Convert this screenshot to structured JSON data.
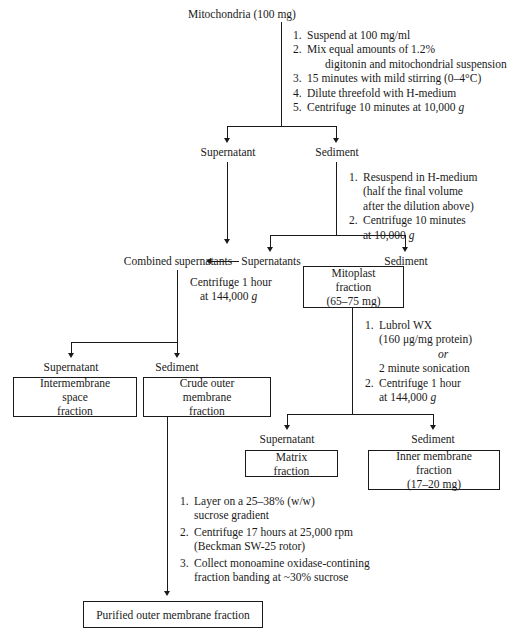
{
  "diagram": {
    "title_node": "Mitochondria (100 mg)",
    "nodes": {
      "supernatant_1": "Supernatant",
      "sediment_1": "Sediment",
      "combined_supernatants": "Combined supernatants",
      "supernatants_2": "Supernatants",
      "sediment_2": "Sediment",
      "supernatant_3": "Supernatant",
      "sediment_3": "Sediment",
      "supernatant_4": "Supernatant",
      "sediment_4": "Sediment"
    },
    "boxes": {
      "mitoplast": {
        "line1": "Mitoplast fraction",
        "line2": "(65–75 mg)"
      },
      "intermembrane": {
        "line1": "Intermembrane space",
        "line2": "fraction"
      },
      "crude_outer": {
        "line1": "Crude outer membrane",
        "line2": "fraction"
      },
      "matrix": {
        "line1": "Matrix fraction"
      },
      "inner_membrane": {
        "line1": "Inner membrane fraction",
        "line2": "(17–20 mg)"
      },
      "purified_outer": {
        "line1": "Purified outer membrane fraction"
      }
    },
    "step_groups": {
      "group1": [
        {
          "num": "1.",
          "text": "Suspend at 100 mg/ml"
        },
        {
          "num": "2.",
          "text": "Mix equal amounts of 1.2%",
          "cont": "digitonin and mitochondrial suspension"
        },
        {
          "num": "3.",
          "text": "15 minutes with mild stirring (0–4°C)"
        },
        {
          "num": "4.",
          "text": "Dilute threefold with H-medium"
        },
        {
          "num": "5.",
          "text": "Centrifuge 10 minutes at 10,000 g",
          "italic_tail": "g"
        }
      ],
      "group2": [
        {
          "num": "1.",
          "text": "Resuspend in H-medium",
          "cont": "(half the final volume",
          "cont2": "after the dilution above)"
        },
        {
          "num": "2.",
          "text": "Centrifuge 10 minutes",
          "cont": "at 10,000 g"
        }
      ],
      "group3": [
        {
          "line1": "Centrifuge 1 hour",
          "line2": "at 144,000 g"
        }
      ],
      "group4": [
        {
          "num": "1.",
          "text": "Lubrol WX",
          "cont": "(160 μg/mg protein)",
          "or": "or",
          "cont_after": "2 minute sonication"
        },
        {
          "num": "2.",
          "text": "Centrifuge 1 hour",
          "cont": "at 144,000 g"
        }
      ],
      "group5": [
        {
          "num": "1.",
          "text": "Layer on a 25–38% (w/w)",
          "cont": "sucrose gradient"
        },
        {
          "num": "2.",
          "text": "Centrifuge 17 hours at 25,000 rpm",
          "cont": "(Beckman SW-25 rotor)"
        },
        {
          "num": "3.",
          "text": "Collect monoamine oxidase-contining",
          "cont": "fraction banding at ~30% sucrose"
        }
      ]
    }
  }
}
